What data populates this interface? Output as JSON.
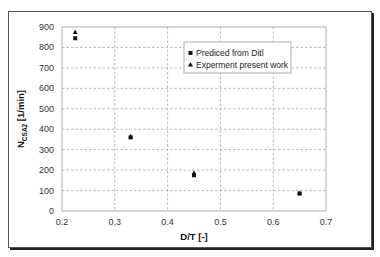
{
  "chart_data": {
    "type": "scatter",
    "title": "",
    "xlabel": "D/T [-]",
    "ylabel": "N",
    "ylabel_sub": "CSA2",
    "ylabel_unit": " [1/min]",
    "xlim": [
      0.2,
      0.7
    ],
    "ylim": [
      0,
      900
    ],
    "xticks": [
      0.2,
      0.3,
      0.4,
      0.5,
      0.6,
      0.7
    ],
    "xtick_labels": [
      "0.2",
      "0.3",
      "0.4",
      "0.5",
      "0.6",
      "0.7"
    ],
    "yticks": [
      0,
      100,
      200,
      300,
      400,
      500,
      600,
      700,
      800,
      900
    ],
    "ytick_labels": [
      "0",
      "100",
      "200",
      "300",
      "400",
      "500",
      "600",
      "700",
      "800",
      "900"
    ],
    "grid": true,
    "legend_position": "upper-center-right",
    "series": [
      {
        "name": "Prediced from Ditl",
        "marker": "square",
        "color": "#111111",
        "x": [
          0.225,
          0.33,
          0.45,
          0.65
        ],
        "y": [
          845,
          360,
          175,
          85
        ]
      },
      {
        "name": "Experment present work",
        "marker": "triangle",
        "color": "#111111",
        "x": [
          0.225,
          0.33,
          0.45,
          0.65
        ],
        "y": [
          875,
          365,
          185,
          88
        ]
      }
    ]
  }
}
